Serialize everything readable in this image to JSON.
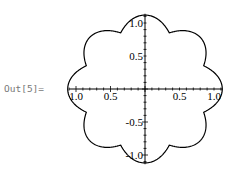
{
  "cell": {
    "output_label": "Out[5]="
  },
  "chart_data": {
    "type": "line",
    "subtype": "polar",
    "title": "",
    "lobes": 8,
    "r_max": 1.12,
    "r_cusp": 0.92,
    "xlabel": "",
    "ylabel": "",
    "xlim": [
      -1.1,
      1.1
    ],
    "ylim": [
      -1.1,
      1.1
    ],
    "x_ticks": [
      "1.0",
      "0.5",
      "0.5",
      "1.0"
    ],
    "x_tick_values": [
      -1.0,
      -0.5,
      0.5,
      1.0
    ],
    "y_ticks": [
      "1.0",
      "0.5",
      "-0.5",
      "-1.0"
    ],
    "y_tick_values": [
      1.0,
      0.5,
      -0.5,
      -1.0
    ],
    "grid": false,
    "legend": null,
    "line_color": "#000000"
  }
}
